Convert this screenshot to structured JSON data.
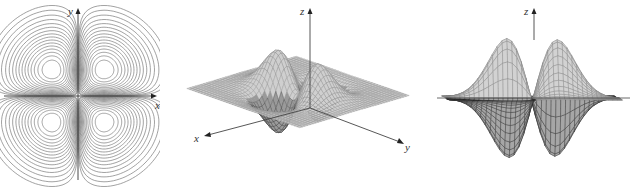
{
  "figure": {
    "panels": [
      {
        "id": "contour",
        "kind": "contour map",
        "axis_labels": {
          "x": "x",
          "y": "y"
        }
      },
      {
        "id": "surface-oblique",
        "kind": "3D wireframe surface (oblique view)",
        "axis_labels": {
          "x": "x",
          "y": "y",
          "z": "z"
        }
      },
      {
        "id": "surface-side",
        "kind": "3D wireframe surface (side view)",
        "axis_labels": {
          "z": "z"
        }
      }
    ],
    "colors": {
      "line": "#7a7a7a",
      "axis": "#333333",
      "dark_mesh": "#2a2a2a",
      "background": "#ffffff"
    }
  },
  "chart_data": [
    {
      "type": "contour",
      "title": "",
      "xlabel": "x",
      "ylabel": "y",
      "description": "Level curves of a four-lobed function f(x,y) with two positive and two negative lobes, one centered in each quadrant",
      "lobe_centers": [
        [
          -1,
          1
        ],
        [
          1,
          1
        ],
        [
          -1,
          -1
        ],
        [
          1,
          -1
        ]
      ],
      "grid": false,
      "legend": null
    },
    {
      "type": "surface",
      "title": "",
      "xlabel": "x",
      "ylabel": "y",
      "zlabel": "z",
      "view": "oblique",
      "description": "Wireframe surface of the same function: two peaks rising above the plane and troughs dipping below it",
      "peaks": 2,
      "troughs": 2
    },
    {
      "type": "surface",
      "title": "",
      "zlabel": "z",
      "view": "side (along one axis)",
      "description": "Side view of the surface showing two peaks above the horizontal plane and two dark troughs below it",
      "peaks": 2,
      "troughs": 2
    }
  ]
}
